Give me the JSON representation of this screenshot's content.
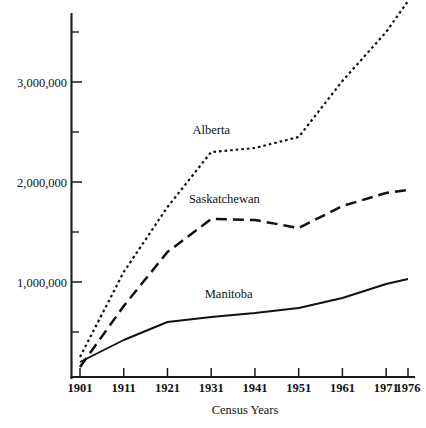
{
  "chart_data": {
    "type": "line",
    "title": "",
    "xlabel": "Census Years",
    "ylabel": "",
    "x": [
      1901,
      1911,
      1921,
      1931,
      1941,
      1951,
      1961,
      1971,
      1976
    ],
    "categories": [
      "1901",
      "1911",
      "1921",
      "1931",
      "1941",
      "1951",
      "1961",
      "1971",
      "1976"
    ],
    "xlim": [
      1901,
      1976
    ],
    "ylim": [
      0,
      3900000
    ],
    "grid": false,
    "legend_position": "inline-on-series",
    "y_ticks_major": [
      1000000,
      2000000,
      3000000
    ],
    "y_tick_labels": [
      "1,000,000",
      "2,000,000",
      "3,000,000"
    ],
    "y_ticks_minor": [
      500000,
      1500000,
      2500000,
      3500000
    ],
    "series": [
      {
        "name": "Alberta",
        "style": "dotted",
        "label_x": 1931,
        "values": [
          250000,
          1100000,
          1750000,
          2300000,
          2340000,
          2450000,
          3010000,
          3500000,
          3810000
        ]
      },
      {
        "name": "Saskatchewan",
        "style": "dashed",
        "label_x": 1934,
        "values": [
          150000,
          760000,
          1300000,
          1630000,
          1620000,
          1540000,
          1760000,
          1890000,
          1920000
        ]
      },
      {
        "name": "Manitoba",
        "style": "solid",
        "label_x": 1935,
        "values": [
          200000,
          420000,
          600000,
          650000,
          690000,
          740000,
          840000,
          980000,
          1030000
        ]
      }
    ]
  },
  "axis": {
    "y_title": "",
    "x_title": "Census Years"
  }
}
